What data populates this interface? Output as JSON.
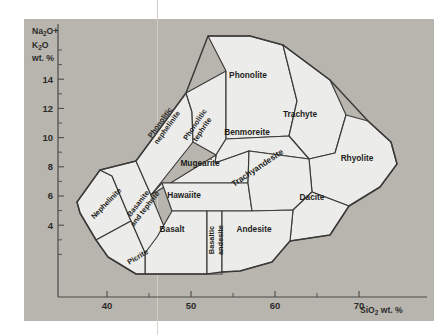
{
  "figure": {
    "panel_bg": "#b8b5ae",
    "field_fill": "#ececea",
    "line_color": "#3a3a38"
  },
  "chart_data": {
    "type": "diagram",
    "title": "",
    "xlabel": "SiO2 wt. %",
    "ylabel": "Na2O+ K2O wt. %",
    "xlim": [
      36,
      78
    ],
    "ylim": [
      0,
      16
    ],
    "grid": false,
    "legend": null,
    "x_ticks": [
      40,
      50,
      60,
      70
    ],
    "x_tick_labels": [
      "40",
      "50",
      "60",
      "70"
    ],
    "x_minor_ticks": [
      45,
      55,
      65
    ],
    "y_ticks": [
      4,
      6,
      8,
      10,
      12,
      14
    ],
    "y_tick_labels": [
      "4",
      "6",
      "8",
      "10",
      "12",
      "14"
    ],
    "y_minor_ticks": [
      2,
      3,
      5,
      7,
      9,
      11,
      13,
      15,
      16
    ],
    "axis_title_x": "SiO2 wt. %",
    "axis_title_x_sub": "2",
    "axis_title_y_line1": "Na2O+",
    "axis_title_y_line2": "K2O",
    "axis_title_y_line3": "wt. %",
    "fields": [
      {
        "name": "Nephelinite",
        "label": "Nephelinite",
        "label_x": 108,
        "label_y": 205,
        "rotate": -46,
        "size": "sm",
        "points": "77,202 80,213 96,240 131,221 112,176 100,170"
      },
      {
        "name": "Basanite and tephrite",
        "label": "Basanite",
        "label2": "and tephrite",
        "label_x": 140,
        "label_y": 205,
        "rotate": -52,
        "size": "sm",
        "two_line": true,
        "points": "100,170 112,176 131,221 145,253 175,253 151,195 136,161"
      },
      {
        "name": "Phonolitic nephelinite",
        "label": "Phonolitic",
        "label2": "nephelinite",
        "label_x": 162,
        "label_y": 124,
        "rotate": -54,
        "size": "sm",
        "two_line": true,
        "points": "136,161 151,195 193,142 192,112 186,93"
      },
      {
        "name": "Phonolitic tephrite",
        "label": "Phonolitic",
        "label2": "tephrite",
        "label_x": 197,
        "label_y": 126,
        "rotate": -56,
        "size": "sm",
        "two_line": true,
        "points": "186,93 192,112 193,142 216,155 226,139 226,71"
      },
      {
        "name": "Phonolite",
        "label": "Phonolite",
        "label_x": 248,
        "label_y": 78,
        "rotate": 0,
        "size": "",
        "points": "226,71 226,139 289,136 297,101 283,45 250,36 208,36"
      },
      {
        "name": "Trachyte",
        "label": "Trachyte",
        "label_x": 300,
        "label_y": 117,
        "rotate": 0,
        "size": "",
        "points": "283,45 297,101 289,136 309,159 335,153 346,115 330,80"
      },
      {
        "name": "Rhyolite",
        "label": "Rhyolite",
        "label_x": 357,
        "label_y": 161,
        "rotate": 0,
        "size": "",
        "points": "346,115 335,153 309,159 312,192 349,206 380,187 397,164 391,142 368,121"
      },
      {
        "name": "Benmoreite",
        "label": "Benmoreite",
        "label_x": 247,
        "label_y": 135,
        "rotate": 0,
        "size": "",
        "points": "216,155 226,139 289,136 309,159 249,151 215,163"
      },
      {
        "name": "Mugearite",
        "label": "Mugearite",
        "label_x": 200,
        "label_y": 166,
        "rotate": 0,
        "size": "",
        "points": "151,195 216,155 215,163 249,151 248,183 162,183"
      },
      {
        "name": "Hawaiite",
        "label": "Hawaiite",
        "label_x": 184,
        "label_y": 198,
        "rotate": 0,
        "size": "",
        "points": "162,183 248,183 252,211 172,211"
      },
      {
        "name": "Trachyandesite",
        "label": "Trachyandesite",
        "label_x": 259,
        "label_y": 170,
        "rotate": -34,
        "size": "",
        "points": "249,151 309,159 312,192 293,210 252,211 248,183"
      },
      {
        "name": "Dacite",
        "label": "Dacite",
        "label_x": 312,
        "label_y": 200,
        "rotate": 0,
        "size": "",
        "points": "312,192 349,206 330,235 290,241 293,210"
      },
      {
        "name": "Basalt",
        "label": "Basalt",
        "label_x": 172,
        "label_y": 232,
        "rotate": 0,
        "size": "",
        "points": "172,211 207,211 207,274 145,274 145,253 157,237"
      },
      {
        "name": "Basaltic andesite",
        "label": "Basaltic",
        "label2": "andesite",
        "label_x": 214,
        "label_y": 240,
        "rotate": -90,
        "size": "sm",
        "two_line": true,
        "points": "207,211 222,211 222,274 207,274"
      },
      {
        "name": "Andesite",
        "label": "Andesite",
        "label_x": 254,
        "label_y": 232,
        "rotate": 0,
        "size": "",
        "points": "222,211 252,211 293,210 290,241 272,262 240,271 222,272"
      },
      {
        "name": "Picrite",
        "label": "Picrite",
        "label_x": 139,
        "label_y": 259,
        "rotate": -31,
        "size": "sm",
        "points": "96,240 131,221 145,253 145,274 136,274 108,257"
      }
    ],
    "outline": "77,202 100,170 136,161 186,93 208,36 250,36 283,45 330,80 368,121 391,142 397,164 380,187 349,206 330,235 290,241 272,262 240,271 222,272 207,274 145,274 136,274 108,257 96,240 80,213"
  }
}
